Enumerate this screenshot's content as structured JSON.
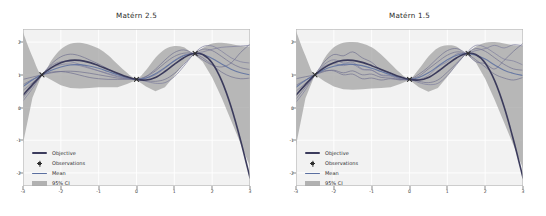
{
  "figure": {
    "background": "#ffffff",
    "panel_background": "#f2f2f2",
    "grid_color": "#ffffff"
  },
  "colors": {
    "objective": "#3b3b5c",
    "mean": "#5a6fa0",
    "observations": "#2f2f2f",
    "ci_band": "#a6a6a6",
    "sample_a": "#6f6f8f",
    "sample_b": "#7d7d9b",
    "tick_text": "#3a3a3a",
    "title_text": "#2b2b2b"
  },
  "legend": {
    "items": [
      {
        "key": "line",
        "label": "Objective",
        "color": "#3b3b5c"
      },
      {
        "key": "marker",
        "label": "Observations",
        "color": "#2f2f2f"
      },
      {
        "key": "line",
        "label": "Mean",
        "color": "#5a6fa0"
      },
      {
        "key": "patch",
        "label": "95% CI",
        "color": "#a6a6a6"
      }
    ]
  },
  "chart_data": [
    {
      "type": "line",
      "title": "Matérn 2.5",
      "xlabel": "",
      "ylabel": "",
      "xlim": [
        -3,
        3
      ],
      "ylim": [
        -2.4,
        2.4
      ],
      "xticks": [
        -3,
        -2,
        -1,
        0,
        1,
        2,
        3
      ],
      "yticks": [
        2,
        1,
        0,
        -1,
        -2
      ],
      "xtick_labels": [
        "-3",
        "-2",
        "-1",
        "0",
        "1",
        "2",
        "3"
      ],
      "ytick_labels": [
        "2",
        "1",
        "0",
        "-1",
        "-2"
      ],
      "grid": true,
      "legend_position": "lower left",
      "x": [
        -3.0,
        -2.75,
        -2.5,
        -2.25,
        -2.0,
        -1.75,
        -1.5,
        -1.25,
        -1.0,
        -0.75,
        -0.5,
        -0.25,
        0.0,
        0.25,
        0.5,
        0.75,
        1.0,
        1.25,
        1.5,
        1.75,
        2.0,
        2.25,
        2.5,
        2.75,
        3.0
      ],
      "observations": {
        "x": [
          -2.5,
          0.0,
          1.55
        ],
        "y": [
          1.0,
          0.86,
          1.65
        ]
      },
      "series": [
        {
          "name": "Objective",
          "color": "#3b3b5c",
          "width": 1.6,
          "values": [
            0.38,
            0.7,
            1.0,
            1.22,
            1.37,
            1.44,
            1.44,
            1.38,
            1.28,
            1.16,
            1.05,
            0.94,
            0.86,
            0.84,
            0.92,
            1.1,
            1.32,
            1.52,
            1.65,
            1.62,
            1.36,
            0.82,
            0.02,
            -1.0,
            -2.15
          ]
        },
        {
          "name": "Mean",
          "color": "#5a6fa0",
          "width": 1.1,
          "values": [
            0.64,
            0.84,
            1.0,
            1.14,
            1.24,
            1.3,
            1.31,
            1.27,
            1.2,
            1.1,
            1.0,
            0.92,
            0.86,
            0.9,
            1.03,
            1.22,
            1.42,
            1.58,
            1.65,
            1.62,
            1.5,
            1.33,
            1.17,
            1.06,
            1.0
          ]
        },
        {
          "name": "Sample 1",
          "color": "#6f6f8f",
          "width": 0.8,
          "values": [
            0.3,
            0.65,
            1.0,
            1.33,
            1.55,
            1.63,
            1.58,
            1.46,
            1.33,
            1.18,
            1.02,
            0.92,
            0.86,
            0.95,
            1.17,
            1.45,
            1.68,
            1.76,
            1.65,
            1.46,
            1.3,
            1.24,
            1.36,
            1.68,
            1.94
          ]
        },
        {
          "name": "Sample 2",
          "color": "#7d7d9b",
          "width": 0.8,
          "values": [
            0.52,
            0.76,
            1.0,
            1.2,
            1.31,
            1.33,
            1.28,
            1.2,
            1.12,
            1.04,
            0.96,
            0.9,
            0.86,
            0.89,
            1.0,
            1.2,
            1.44,
            1.6,
            1.65,
            1.7,
            1.78,
            1.84,
            1.86,
            1.88,
            1.9
          ]
        },
        {
          "name": "Sample 3",
          "color": "#6f6f8f",
          "width": 0.8,
          "values": [
            0.86,
            0.93,
            1.0,
            1.06,
            1.1,
            1.11,
            1.09,
            1.05,
            1.0,
            0.95,
            0.9,
            0.88,
            0.86,
            0.94,
            1.12,
            1.36,
            1.56,
            1.66,
            1.65,
            1.52,
            1.3,
            1.08,
            0.94,
            0.88,
            0.9
          ]
        },
        {
          "name": "Sample 4",
          "color": "#7d7d9b",
          "width": 0.8,
          "values": [
            0.2,
            0.58,
            1.0,
            1.28,
            1.4,
            1.4,
            1.32,
            1.22,
            1.12,
            1.02,
            0.94,
            0.89,
            0.86,
            0.8,
            0.74,
            0.76,
            0.94,
            1.26,
            1.62,
            1.86,
            1.88,
            1.72,
            1.52,
            1.4,
            1.36
          ]
        },
        {
          "name": "Sample 5",
          "color": "#6f6f8f",
          "width": 0.8,
          "values": [
            0.7,
            0.86,
            1.0,
            1.08,
            1.1,
            1.06,
            0.99,
            0.92,
            0.88,
            0.86,
            0.86,
            0.86,
            0.86,
            0.82,
            0.8,
            0.86,
            1.04,
            1.32,
            1.62,
            1.78,
            1.74,
            1.56,
            1.36,
            1.22,
            1.16
          ]
        }
      ],
      "ci": {
        "upper": [
          2.3,
          1.55,
          1.0,
          1.44,
          1.78,
          1.95,
          1.98,
          1.92,
          1.8,
          1.6,
          1.32,
          1.06,
          0.88,
          1.14,
          1.52,
          1.78,
          1.88,
          1.84,
          1.66,
          1.82,
          1.96,
          1.98,
          1.94,
          1.88,
          1.86
        ],
        "lower": [
          -1.1,
          0.3,
          1.0,
          0.84,
          0.68,
          0.6,
          0.58,
          0.6,
          0.62,
          0.62,
          0.62,
          0.72,
          0.84,
          0.64,
          0.5,
          0.62,
          0.96,
          1.34,
          1.64,
          1.4,
          0.92,
          0.3,
          -0.4,
          -1.1,
          -1.8
        ]
      }
    },
    {
      "type": "line",
      "title": "Matérn 1.5",
      "xlabel": "",
      "ylabel": "",
      "xlim": [
        -3,
        3
      ],
      "ylim": [
        -2.4,
        2.4
      ],
      "xticks": [
        -3,
        -2,
        -1,
        0,
        1,
        2,
        3
      ],
      "yticks": [
        2,
        1,
        0,
        -1,
        -2
      ],
      "xtick_labels": [
        "-3",
        "-2",
        "-1",
        "0",
        "1",
        "2",
        "3"
      ],
      "ytick_labels": [
        "2",
        "1",
        "0",
        "-1",
        "-2"
      ],
      "grid": true,
      "legend_position": "lower left",
      "x": [
        -3.0,
        -2.75,
        -2.5,
        -2.25,
        -2.0,
        -1.75,
        -1.5,
        -1.25,
        -1.0,
        -0.75,
        -0.5,
        -0.25,
        0.0,
        0.25,
        0.5,
        0.75,
        1.0,
        1.25,
        1.5,
        1.75,
        2.0,
        2.25,
        2.5,
        2.75,
        3.0
      ],
      "observations": {
        "x": [
          -2.5,
          0.0,
          1.55
        ],
        "y": [
          1.0,
          0.86,
          1.65
        ]
      },
      "series": [
        {
          "name": "Objective",
          "color": "#3b3b5c",
          "width": 1.6,
          "values": [
            0.38,
            0.7,
            1.0,
            1.22,
            1.37,
            1.44,
            1.44,
            1.38,
            1.28,
            1.16,
            1.05,
            0.94,
            0.86,
            0.84,
            0.92,
            1.1,
            1.32,
            1.52,
            1.65,
            1.62,
            1.36,
            0.82,
            0.02,
            -1.0,
            -2.15
          ]
        },
        {
          "name": "Mean",
          "color": "#5a6fa0",
          "width": 1.1,
          "values": [
            0.62,
            0.83,
            1.0,
            1.16,
            1.26,
            1.32,
            1.32,
            1.28,
            1.2,
            1.1,
            1.0,
            0.92,
            0.86,
            0.92,
            1.06,
            1.26,
            1.46,
            1.6,
            1.65,
            1.6,
            1.48,
            1.3,
            1.14,
            1.04,
            0.98
          ]
        },
        {
          "name": "Sample 1",
          "color": "#6f6f8f",
          "width": 0.8,
          "values": [
            0.26,
            0.62,
            1.0,
            1.4,
            1.62,
            1.58,
            1.7,
            1.52,
            1.38,
            1.14,
            1.06,
            0.88,
            0.86,
            1.02,
            1.24,
            1.52,
            1.74,
            1.8,
            1.65,
            1.4,
            1.34,
            1.18,
            1.44,
            1.72,
            1.96
          ]
        },
        {
          "name": "Sample 2",
          "color": "#7d7d9b",
          "width": 0.8,
          "values": [
            0.5,
            0.74,
            1.0,
            1.26,
            1.34,
            1.28,
            1.32,
            1.16,
            1.14,
            1.0,
            0.98,
            0.88,
            0.86,
            0.86,
            0.98,
            1.24,
            1.4,
            1.64,
            1.65,
            1.74,
            1.8,
            1.9,
            1.82,
            1.92,
            1.88
          ]
        },
        {
          "name": "Sample 3",
          "color": "#6f6f8f",
          "width": 0.8,
          "values": [
            0.88,
            0.94,
            1.0,
            1.1,
            1.14,
            1.06,
            1.12,
            1.0,
            1.02,
            0.92,
            0.9,
            0.86,
            0.86,
            0.96,
            1.18,
            1.4,
            1.6,
            1.7,
            1.65,
            1.46,
            1.24,
            1.02,
            0.9,
            0.84,
            0.92
          ]
        },
        {
          "name": "Sample 4",
          "color": "#7d7d9b",
          "width": 0.8,
          "values": [
            0.16,
            0.54,
            1.0,
            1.32,
            1.46,
            1.36,
            1.38,
            1.18,
            1.14,
            0.98,
            0.96,
            0.86,
            0.86,
            0.76,
            0.7,
            0.74,
            0.98,
            1.32,
            1.66,
            1.9,
            1.84,
            1.66,
            1.48,
            1.42,
            1.3
          ]
        },
        {
          "name": "Sample 5",
          "color": "#6f6f8f",
          "width": 0.8,
          "values": [
            0.68,
            0.84,
            1.0,
            1.12,
            1.12,
            1.0,
            1.02,
            0.88,
            0.9,
            0.84,
            0.88,
            0.84,
            0.86,
            0.8,
            0.76,
            0.84,
            1.08,
            1.36,
            1.64,
            1.8,
            1.72,
            1.52,
            1.32,
            1.18,
            1.14
          ]
        }
      ],
      "ci": {
        "upper": [
          2.34,
          1.58,
          1.0,
          1.5,
          1.84,
          1.98,
          2.0,
          1.96,
          1.84,
          1.62,
          1.34,
          1.06,
          0.88,
          1.18,
          1.56,
          1.82,
          1.9,
          1.86,
          1.66,
          1.86,
          1.98,
          2.0,
          1.96,
          1.9,
          1.88
        ],
        "lower": [
          -1.16,
          0.28,
          1.0,
          0.8,
          0.64,
          0.56,
          0.54,
          0.56,
          0.58,
          0.6,
          0.62,
          0.72,
          0.84,
          0.62,
          0.48,
          0.6,
          0.94,
          1.32,
          1.64,
          1.38,
          0.88,
          0.24,
          -0.46,
          -1.16,
          -1.86
        ]
      }
    }
  ]
}
